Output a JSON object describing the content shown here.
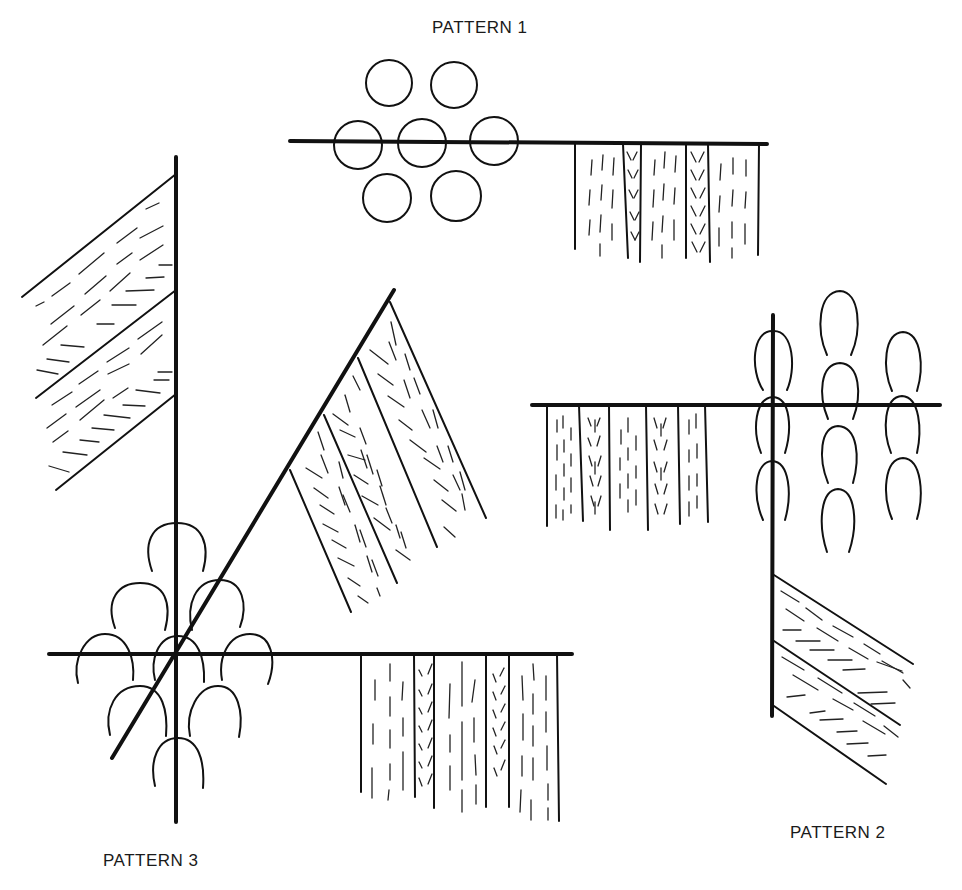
{
  "diagram": {
    "colors": {
      "ink": "#111111",
      "background": "#ffffff"
    },
    "patterns": [
      {
        "id": "pattern-1",
        "label": "PATTERN 1",
        "label_position": {
          "x": 432,
          "y": 18
        },
        "description": "Horizontal line with seven circles in a hexagonal cluster and a vertical striped panel hanging below"
      },
      {
        "id": "pattern-2",
        "label": "PATTERN 2",
        "label_position": {
          "x": 790,
          "y": 823
        },
        "description": "Cross of horizontal and vertical lines with rows of loops, a vertical striped panel to the left and a diagonal striped panel below"
      },
      {
        "id": "pattern-3",
        "label": "PATTERN 3",
        "label_position": {
          "x": 103,
          "y": 851
        },
        "description": "Horizontal, vertical and diagonal lines crossing with arcs in a diamond cluster and three striped panels"
      }
    ]
  }
}
